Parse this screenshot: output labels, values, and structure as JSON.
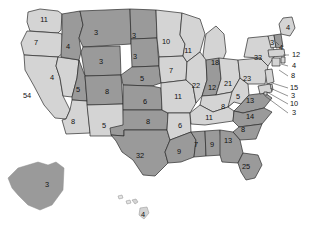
{
  "chart_data": {
    "type": "map",
    "title": "",
    "subtitle": "",
    "map_scope": "United States (50 states + DC), Albers projection with Alaska and Hawaii insets",
    "value_label": "Electoral votes",
    "legend": {
      "visible": false,
      "position": "none"
    },
    "color_scale": {
      "type": "two-tone categorical shading",
      "dark": "#9a9a9a",
      "light": "#d4d4d4",
      "border": "#2b2b2b",
      "background": "#ffffff",
      "label_color": "#111111"
    },
    "total_value": 538,
    "regions": [
      {
        "code": "WA",
        "name": "Washington",
        "value": 11,
        "shade": "light",
        "label_x": 44,
        "label_y": 20
      },
      {
        "code": "OR",
        "name": "Oregon",
        "value": 7,
        "shade": "light",
        "label_x": 36,
        "label_y": 43
      },
      {
        "code": "CA",
        "name": "California",
        "value": 54,
        "shade": "light",
        "label_x": 27,
        "label_y": 96
      },
      {
        "code": "NV",
        "name": "Nevada",
        "value": 4,
        "shade": "light",
        "label_x": 52,
        "label_y": 78
      },
      {
        "code": "ID",
        "name": "Idaho",
        "value": 4,
        "shade": "dark",
        "label_x": 68,
        "label_y": 47
      },
      {
        "code": "MT",
        "name": "Montana",
        "value": 3,
        "shade": "dark",
        "label_x": 96,
        "label_y": 33
      },
      {
        "code": "WY",
        "name": "Wyoming",
        "value": 3,
        "shade": "dark",
        "label_x": 101,
        "label_y": 62
      },
      {
        "code": "UT",
        "name": "Utah",
        "value": 5,
        "shade": "dark",
        "label_x": 78,
        "label_y": 90
      },
      {
        "code": "AZ",
        "name": "Arizona",
        "value": 8,
        "shade": "light",
        "label_x": 73,
        "label_y": 122
      },
      {
        "code": "CO",
        "name": "Colorado",
        "value": 8,
        "shade": "dark",
        "label_x": 107,
        "label_y": 92
      },
      {
        "code": "NM",
        "name": "New Mexico",
        "value": 5,
        "shade": "light",
        "label_x": 104,
        "label_y": 126
      },
      {
        "code": "ND",
        "name": "North Dakota",
        "value": 3,
        "shade": "dark",
        "label_x": 134,
        "label_y": 36
      },
      {
        "code": "SD",
        "name": "South Dakota",
        "value": 3,
        "shade": "dark",
        "label_x": 135,
        "label_y": 57
      },
      {
        "code": "NE",
        "name": "Nebraska",
        "value": 5,
        "shade": "dark",
        "label_x": 142,
        "label_y": 79
      },
      {
        "code": "KS",
        "name": "Kansas",
        "value": 6,
        "shade": "dark",
        "label_x": 145,
        "label_y": 102
      },
      {
        "code": "OK",
        "name": "Oklahoma",
        "value": 8,
        "shade": "dark",
        "label_x": 148,
        "label_y": 122
      },
      {
        "code": "TX",
        "name": "Texas",
        "value": 32,
        "shade": "dark",
        "label_x": 140,
        "label_y": 156
      },
      {
        "code": "MN",
        "name": "Minnesota",
        "value": 10,
        "shade": "light",
        "label_x": 166,
        "label_y": 42
      },
      {
        "code": "IA",
        "name": "Iowa",
        "value": 7,
        "shade": "light",
        "label_x": 171,
        "label_y": 71
      },
      {
        "code": "MO",
        "name": "Missouri",
        "value": 11,
        "shade": "light",
        "label_x": 178,
        "label_y": 97
      },
      {
        "code": "AR",
        "name": "Arkansas",
        "value": 6,
        "shade": "light",
        "label_x": 180,
        "label_y": 126
      },
      {
        "code": "LA",
        "name": "Louisiana",
        "value": 9,
        "shade": "dark",
        "label_x": 179,
        "label_y": 152
      },
      {
        "code": "MS",
        "name": "Mississippi",
        "value": 7,
        "shade": "dark",
        "label_x": 196,
        "label_y": 145
      },
      {
        "code": "AL",
        "name": "Alabama",
        "value": 9,
        "shade": "dark",
        "label_x": 212,
        "label_y": 145
      },
      {
        "code": "WI",
        "name": "Wisconsin",
        "value": 11,
        "shade": "light",
        "label_x": 188,
        "label_y": 51
      },
      {
        "code": "MI",
        "name": "Michigan",
        "value": 18,
        "shade": "light",
        "label_x": 215,
        "label_y": 63
      },
      {
        "code": "IL",
        "name": "Illinois",
        "value": 22,
        "shade": "light",
        "label_x": 196,
        "label_y": 86
      },
      {
        "code": "IN",
        "name": "Indiana",
        "value": 12,
        "shade": "dark",
        "label_x": 212,
        "label_y": 88
      },
      {
        "code": "OH",
        "name": "Ohio",
        "value": 21,
        "shade": "light",
        "label_x": 228,
        "label_y": 84
      },
      {
        "code": "KY",
        "name": "Kentucky",
        "value": 8,
        "shade": "light",
        "label_x": 223,
        "label_y": 107
      },
      {
        "code": "TN",
        "name": "Tennessee",
        "value": 11,
        "shade": "light",
        "label_x": 209,
        "label_y": 118
      },
      {
        "code": "WV",
        "name": "West Virginia",
        "value": 5,
        "shade": "light",
        "label_x": 238,
        "label_y": 97
      },
      {
        "code": "VA",
        "name": "Virginia",
        "value": 13,
        "shade": "dark",
        "label_x": 250,
        "label_y": 101
      },
      {
        "code": "NC",
        "name": "North Carolina",
        "value": 14,
        "shade": "dark",
        "label_x": 250,
        "label_y": 117
      },
      {
        "code": "SC",
        "name": "South Carolina",
        "value": 8,
        "shade": "dark",
        "label_x": 243,
        "label_y": 130
      },
      {
        "code": "GA",
        "name": "Georgia",
        "value": 13,
        "shade": "dark",
        "label_x": 228,
        "label_y": 141
      },
      {
        "code": "FL",
        "name": "Florida",
        "value": 25,
        "shade": "dark",
        "label_x": 246,
        "label_y": 167
      },
      {
        "code": "PA",
        "name": "Pennsylvania",
        "value": 23,
        "shade": "light",
        "label_x": 247,
        "label_y": 79
      },
      {
        "code": "NY",
        "name": "New York",
        "value": 33,
        "shade": "light",
        "label_x": 258,
        "label_y": 58
      },
      {
        "code": "ME",
        "name": "Maine",
        "value": 4,
        "shade": "light",
        "label_x": 288,
        "label_y": 28
      },
      {
        "code": "VT",
        "name": "Vermont",
        "value": 3,
        "shade": "light",
        "label_x": 272,
        "label_y": 43
      },
      {
        "code": "NH",
        "name": "New Hampshire",
        "value": 4,
        "shade": "dark",
        "label_x": 281,
        "label_y": 48
      },
      {
        "code": "MA",
        "name": "Massachusetts",
        "value": 12,
        "shade": "light",
        "label_x": 296,
        "label_y": 55
      },
      {
        "code": "RI",
        "name": "Rhode Island",
        "value": 4,
        "shade": "light",
        "label_x": 294,
        "label_y": 66
      },
      {
        "code": "CT",
        "name": "Connecticut",
        "value": 8,
        "shade": "light",
        "label_x": 293,
        "label_y": 76
      },
      {
        "code": "NJ",
        "name": "New Jersey",
        "value": 15,
        "shade": "light",
        "label_x": 294,
        "label_y": 88
      },
      {
        "code": "DE",
        "name": "Delaware",
        "value": 3,
        "shade": "light",
        "label_x": 293,
        "label_y": 96
      },
      {
        "code": "MD",
        "name": "Maryland",
        "value": 10,
        "shade": "light",
        "label_x": 294,
        "label_y": 104
      },
      {
        "code": "DC",
        "name": "District of Columbia",
        "value": 3,
        "shade": "light",
        "label_x": 294,
        "label_y": 113
      },
      {
        "code": "AK",
        "name": "Alaska",
        "value": 3,
        "shade": "dark",
        "label_x": 47,
        "label_y": 185
      },
      {
        "code": "HI",
        "name": "Hawaii",
        "value": 4,
        "shade": "light",
        "label_x": 143,
        "label_y": 215
      }
    ]
  }
}
